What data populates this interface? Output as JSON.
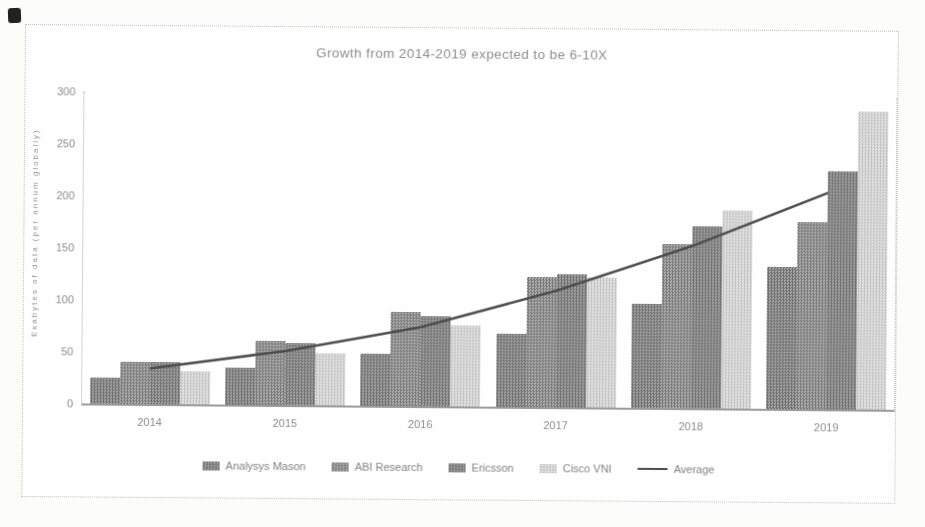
{
  "chart_data": {
    "type": "bar",
    "title": "Growth from 2014-2019 expected to be 6-10X",
    "ylabel": "Exabytes of data  (per annum globally)",
    "xlabel": "",
    "categories": [
      "2014",
      "2015",
      "2016",
      "2017",
      "2018",
      "2019"
    ],
    "series": [
      {
        "name": "Analysys Mason",
        "values": [
          25,
          36,
          50,
          70,
          100,
          137
        ]
      },
      {
        "name": "ABI Research",
        "values": [
          40,
          62,
          90,
          125,
          158,
          180
        ]
      },
      {
        "name": "Ericsson",
        "values": [
          40,
          60,
          87,
          128,
          175,
          229
        ]
      },
      {
        "name": "Cisco VNI",
        "values": [
          32,
          50,
          78,
          125,
          190,
          287
        ]
      }
    ],
    "line_series": {
      "name": "Average",
      "values": [
        34,
        52,
        76,
        112,
        156,
        208
      ]
    },
    "yticks": [
      0,
      50,
      100,
      150,
      200,
      250,
      300
    ],
    "ylim": [
      0,
      300
    ],
    "grid": false,
    "legend_position": "bottom"
  },
  "colors": {
    "series_checker": [
      {
        "dark": "#6f6f6f",
        "light": "#a8a8a8"
      },
      {
        "dark": "#797979",
        "light": "#b1b1b1"
      },
      {
        "dark": "#717171",
        "light": "#a6a6a6"
      },
      {
        "dark": "#c3c3c3",
        "light": "#e8e8e8"
      }
    ],
    "average_line": "#4e4e4e",
    "text": "#8a8a8a",
    "axis": "#9b9b9b",
    "frame_border": "#bfbfbf"
  }
}
